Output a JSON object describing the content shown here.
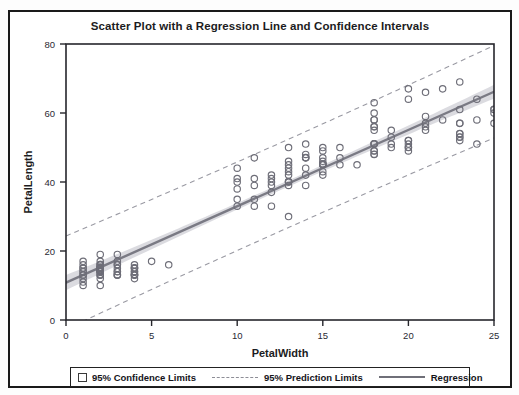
{
  "chart_data": {
    "type": "scatter",
    "title": "Scatter Plot with a Regression Line and Confidence Intervals",
    "xlabel": "PetalWidth",
    "ylabel": "PetalLength",
    "xlim": [
      0,
      25
    ],
    "ylim": [
      0,
      80
    ],
    "xticks": [
      0,
      5,
      10,
      15,
      20,
      25
    ],
    "yticks": [
      0,
      20,
      40,
      60,
      80
    ],
    "xtick_labels": [
      "0",
      "5",
      "10",
      "15",
      "20",
      "25"
    ],
    "ytick_labels": [
      "0",
      "20",
      "40",
      "60",
      "80"
    ],
    "grid": false,
    "legend_position": "bottom",
    "marker": "open-circle",
    "marker_color": "#6e6e78",
    "regression_color": "#7a7a84",
    "band_color": "#cfcfd6",
    "prediction_color": "#9a9aa3",
    "regression": {
      "slope": 2.2129,
      "intercept": 10.836,
      "x_start": 0,
      "x_end": 25,
      "y_start": 10.8,
      "y_end": 66.2
    },
    "confidence_band": {
      "level": "95%",
      "half_width_at_xmin": 2.2,
      "half_width_at_mean": 0.9,
      "half_width_at_xmax": 2.0
    },
    "prediction_band": {
      "level": "95%",
      "half_width_at_xmin": 13.5,
      "half_width_at_mean": 12.8,
      "half_width_at_xmax": 13.4
    },
    "points": [
      [
        2,
        14
      ],
      [
        2,
        14
      ],
      [
        2,
        13
      ],
      [
        2,
        15
      ],
      [
        2,
        14
      ],
      [
        2,
        14
      ],
      [
        2,
        13
      ],
      [
        2,
        15
      ],
      [
        2,
        14
      ],
      [
        2,
        14
      ],
      [
        1,
        11
      ],
      [
        1,
        12
      ],
      [
        1,
        10
      ],
      [
        1,
        14
      ],
      [
        1,
        13
      ],
      [
        1,
        15
      ],
      [
        1,
        15
      ],
      [
        1,
        16
      ],
      [
        1,
        14
      ],
      [
        1,
        13
      ],
      [
        2,
        16
      ],
      [
        2,
        19
      ],
      [
        2,
        14
      ],
      [
        2,
        16
      ],
      [
        2,
        14
      ],
      [
        2,
        15
      ],
      [
        2,
        14
      ],
      [
        2,
        15
      ],
      [
        2,
        12
      ],
      [
        2,
        13
      ],
      [
        3,
        17
      ],
      [
        3,
        15
      ],
      [
        3,
        13
      ],
      [
        3,
        13
      ],
      [
        3,
        13
      ],
      [
        3,
        16
      ],
      [
        3,
        19
      ],
      [
        3,
        14
      ],
      [
        3,
        16
      ],
      [
        3,
        14
      ],
      [
        4,
        15
      ],
      [
        4,
        14
      ],
      [
        4,
        15
      ],
      [
        4,
        12
      ],
      [
        4,
        13
      ],
      [
        4,
        14
      ],
      [
        4,
        13
      ],
      [
        4,
        15
      ],
      [
        4,
        13
      ],
      [
        4,
        13
      ],
      [
        5,
        17
      ],
      [
        6,
        16
      ],
      [
        2,
        10
      ],
      [
        2,
        16
      ],
      [
        2,
        17
      ],
      [
        4,
        16
      ],
      [
        1,
        17
      ],
      [
        2,
        15
      ],
      [
        2,
        15
      ],
      [
        2,
        14
      ],
      [
        14,
        47
      ],
      [
        15,
        45
      ],
      [
        15,
        49
      ],
      [
        13,
        40
      ],
      [
        15,
        46
      ],
      [
        13,
        45
      ],
      [
        16,
        47
      ],
      [
        10,
        33
      ],
      [
        13,
        46
      ],
      [
        14,
        39
      ],
      [
        10,
        35
      ],
      [
        15,
        42
      ],
      [
        10,
        40
      ],
      [
        14,
        47
      ],
      [
        13,
        39
      ],
      [
        14,
        44
      ],
      [
        15,
        45
      ],
      [
        10,
        41
      ],
      [
        15,
        45
      ],
      [
        11,
        39
      ],
      [
        18,
        48
      ],
      [
        13,
        50
      ],
      [
        15,
        43
      ],
      [
        12,
        40
      ],
      [
        13,
        44
      ],
      [
        14,
        47
      ],
      [
        14,
        48
      ],
      [
        16,
        50
      ],
      [
        15,
        45
      ],
      [
        11,
        35
      ],
      [
        10,
        38
      ],
      [
        12,
        37
      ],
      [
        12,
        39
      ],
      [
        14,
        51
      ],
      [
        15,
        45
      ],
      [
        16,
        45
      ],
      [
        15,
        47
      ],
      [
        11,
        47
      ],
      [
        10,
        44
      ],
      [
        11,
        41
      ],
      [
        13,
        40
      ],
      [
        12,
        33
      ],
      [
        13,
        42
      ],
      [
        12,
        42
      ],
      [
        14,
        42
      ],
      [
        13,
        43
      ],
      [
        13,
        30
      ],
      [
        12,
        41
      ],
      [
        13,
        40
      ],
      [
        11,
        33
      ],
      [
        25,
        60
      ],
      [
        19,
        51
      ],
      [
        21,
        59
      ],
      [
        18,
        56
      ],
      [
        22,
        58
      ],
      [
        21,
        66
      ],
      [
        17,
        45
      ],
      [
        18,
        63
      ],
      [
        18,
        58
      ],
      [
        25,
        61
      ],
      [
        20,
        51
      ],
      [
        19,
        53
      ],
      [
        21,
        55
      ],
      [
        20,
        50
      ],
      [
        24,
        51
      ],
      [
        23,
        53
      ],
      [
        18,
        55
      ],
      [
        22,
        67
      ],
      [
        23,
        69
      ],
      [
        15,
        50
      ],
      [
        23,
        57
      ],
      [
        20,
        49
      ],
      [
        20,
        67
      ],
      [
        18,
        49
      ],
      [
        21,
        57
      ],
      [
        18,
        60
      ],
      [
        18,
        48
      ],
      [
        18,
        49
      ],
      [
        21,
        56
      ],
      [
        24,
        58
      ],
      [
        23,
        61
      ],
      [
        24,
        64
      ],
      [
        18,
        56
      ],
      [
        18,
        51
      ],
      [
        18,
        58
      ],
      [
        25,
        61
      ],
      [
        20,
        64
      ],
      [
        23,
        53
      ],
      [
        19,
        55
      ],
      [
        20,
        50
      ],
      [
        20,
        52
      ],
      [
        23,
        54
      ],
      [
        18,
        51
      ],
      [
        23,
        57
      ],
      [
        25,
        57
      ],
      [
        23,
        52
      ],
      [
        19,
        50
      ],
      [
        20,
        52
      ],
      [
        23,
        54
      ],
      [
        18,
        51
      ]
    ]
  },
  "legend": {
    "entries": [
      {
        "label": "95% Confidence Limits",
        "swatch": "square-swatch"
      },
      {
        "label": "95% Prediction Limits",
        "swatch": "dashed-line-swatch"
      },
      {
        "label": "Regression",
        "swatch": "solid-line-swatch"
      }
    ]
  }
}
